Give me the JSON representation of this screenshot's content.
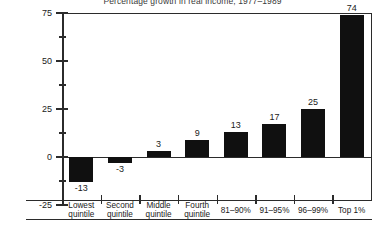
{
  "chart_data": {
    "type": "bar",
    "title": "Percentage growth in real income, 1977–1989",
    "xlabel": "",
    "ylabel": "",
    "ylim": [
      -25,
      75
    ],
    "yticks": [
      -25,
      0,
      25,
      50,
      75
    ],
    "ytick_labels": [
      "-25",
      "0",
      "25",
      "50",
      "75"
    ],
    "minor_yticks": [
      -12.5,
      12.5,
      37.5,
      62.5
    ],
    "grid": false,
    "legend": "none",
    "bar_color": "#101010",
    "categories": [
      "Lowest quintile",
      "Second quintile",
      "Middle quintile",
      "Fourth quintile",
      "81–90%",
      "91–95%",
      "96–99%",
      "Top 1%"
    ],
    "category_lines": [
      [
        "Lowest",
        "quintile"
      ],
      [
        "Second",
        "quintile"
      ],
      [
        "Middle",
        "quintile"
      ],
      [
        "Fourth",
        "quintile"
      ],
      [
        "81–90%"
      ],
      [
        "91–95%"
      ],
      [
        "96–99%"
      ],
      [
        "Top 1%"
      ]
    ],
    "values": [
      -13,
      -3,
      3,
      9,
      13,
      17,
      25,
      74
    ],
    "value_labels": [
      "-13",
      "-3",
      "3",
      "9",
      "13",
      "17",
      "25",
      "74"
    ]
  }
}
